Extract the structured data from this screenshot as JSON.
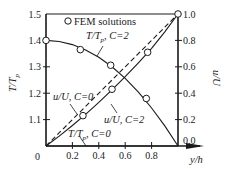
{
  "chart_data": {
    "type": "line",
    "title": "",
    "xlabel": "y/h",
    "ylabel_left": "T/T_p",
    "ylabel_right": "u/U",
    "xlim": [
      0,
      1
    ],
    "ylim_left": [
      1.0,
      1.5
    ],
    "ylim_right": [
      0.0,
      1.0
    ],
    "x_ticks": [
      0,
      0.2,
      0.4,
      0.6,
      0.8
    ],
    "x_tick_labels": [
      "0",
      "0.2",
      "0.4",
      "0.6",
      "0.8"
    ],
    "y_left_ticks": [
      1.1,
      1.2,
      1.3,
      1.4,
      1.5
    ],
    "y_left_tick_labels": [
      "1.1",
      "1.2",
      "1.3",
      "1.4",
      "1.5"
    ],
    "y_right_ticks": [
      0.0,
      0.2,
      0.4,
      0.6,
      0.8,
      1.0
    ],
    "y_right_tick_labels": [
      "0.0",
      "0.2",
      "0.4",
      "0.6",
      "0.8",
      "1.0"
    ],
    "grid": false,
    "legend": {
      "position": "top",
      "entries": [
        "FEM solutions"
      ]
    },
    "series": [
      {
        "name": "T/T_p, C=2",
        "axis": "left",
        "style": "solid",
        "x": [
          0,
          0.1,
          0.2,
          0.3,
          0.4,
          0.5,
          0.6,
          0.7,
          0.8,
          0.9,
          1.0
        ],
        "y": [
          1.4,
          1.396,
          1.384,
          1.364,
          1.336,
          1.3,
          1.256,
          1.204,
          1.144,
          1.076,
          1.0
        ]
      },
      {
        "name": "T/T_p, C=0",
        "axis": "left",
        "style": "solid",
        "x": [
          0,
          1.0
        ],
        "y": [
          1.0,
          1.0
        ]
      },
      {
        "name": "u/U, C=0",
        "axis": "right",
        "style": "dashed",
        "x": [
          0,
          1.0
        ],
        "y": [
          0.0,
          1.0
        ]
      },
      {
        "name": "u/U, C=2",
        "axis": "right",
        "style": "solid",
        "x": [
          0,
          0.1,
          0.2,
          0.3,
          0.4,
          0.5,
          0.6,
          0.7,
          0.8,
          0.9,
          1.0
        ],
        "y": [
          0.0,
          0.075,
          0.155,
          0.24,
          0.33,
          0.425,
          0.525,
          0.63,
          0.74,
          0.865,
          1.0
        ]
      }
    ],
    "markers": [
      {
        "name": "FEM T/T_p, C=2",
        "axis": "left",
        "x": [
          0,
          0.26,
          0.49,
          0.76
        ],
        "y": [
          1.4,
          1.365,
          1.306,
          1.18
        ]
      },
      {
        "name": "FEM u/U, C=2",
        "axis": "right",
        "x": [
          0.28,
          0.5,
          0.77,
          1.0
        ],
        "y": [
          0.23,
          0.43,
          0.71,
          1.0
        ]
      }
    ],
    "annotations": [
      {
        "text": "T/T_p, C=2",
        "x": 0.42,
        "y_left": 1.435
      },
      {
        "text": "u/U, C=0",
        "x": 0.12,
        "y_right": 0.38
      },
      {
        "text": "u/U, C=2",
        "x": 0.55,
        "y_right": 0.22
      },
      {
        "text": "T/T_p, C=0",
        "x": 0.42,
        "y_right": 0.09
      }
    ]
  },
  "labels": {
    "legend": "FEM solutions",
    "x_axis": "y/h",
    "y_left_main": "T/T",
    "y_left_sub": "p",
    "y_right": "u/U",
    "ann_t_c2_main": "T/T",
    "ann_t_c2_sub": "p",
    "ann_t_c2_tail": ", C=2",
    "ann_u_c0": "u/U, C=0",
    "ann_u_c2": "u/U, C=2",
    "ann_t_c0_main": "T/T",
    "ann_t_c0_sub": "p",
    "ann_t_c0_tail": ", C=0",
    "origin": "0"
  },
  "colors": {
    "line": "#1a1a1a",
    "background": "#ffffff"
  }
}
